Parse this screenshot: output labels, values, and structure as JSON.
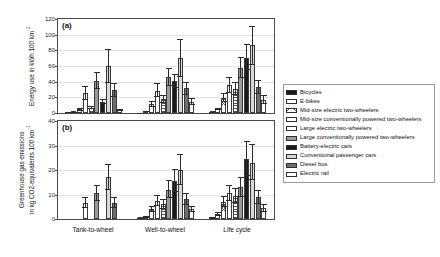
{
  "figure": {
    "panel_a_tag": "(a)",
    "panel_b_tag": "(b)"
  },
  "axes": {
    "panel_a": {
      "title_line1": "Energy use in kWh 100 km",
      "title_sup": "-1",
      "ticks": [
        "0",
        "20",
        "40",
        "60",
        "80",
        "100",
        "120"
      ]
    },
    "panel_b": {
      "title_line1": "Greenhouse gas emissions",
      "title_line2": "in kg CO2-equivalents 100 km",
      "title_sup": "-1",
      "ticks": [
        "0",
        "10",
        "20",
        "30",
        "40"
      ]
    },
    "x_categories": [
      "Tank-to-wheel",
      "Well-to-wheel",
      "Life cycle"
    ]
  },
  "legend": {
    "items": [
      {
        "label": "Bicycles",
        "fill": "f-black"
      },
      {
        "label": "E-bikes",
        "fill": "f-hatchdot"
      },
      {
        "label": "Mid-size electric two-wheelers",
        "fill": "f-hatchcross"
      },
      {
        "label": "Mid-size conventionally powered two-wheelers",
        "fill": "f-white"
      },
      {
        "label": "Large electric two-wheelers",
        "fill": "f-hatchfine"
      },
      {
        "label": "Large conventionally powered two-wheelers",
        "fill": "f-midgray"
      },
      {
        "label": "Battery-electric cars",
        "fill": "f-black"
      },
      {
        "label": "Conventional passenger cars",
        "fill": "f-ltgray"
      },
      {
        "label": "Diesel bus",
        "fill": "f-dkgray"
      },
      {
        "label": "Electric rail",
        "fill": "f-white"
      }
    ]
  },
  "chart_data": {
    "type": "bar",
    "title": "",
    "grid": true,
    "legend_position": "right",
    "series_names": [
      "Bicycles",
      "E-bikes",
      "Mid-size electric two-wheelers",
      "Mid-size conventionally powered two-wheelers",
      "Large electric two-wheelers",
      "Large conventionally powered two-wheelers",
      "Battery-electric cars",
      "Conventional passenger cars",
      "Diesel bus",
      "Electric rail"
    ],
    "panels": [
      {
        "tag": "(a)",
        "ylabel": "Energy use in kWh 100 km-1",
        "ylim": [
          0,
          120
        ],
        "yticks": [
          0,
          20,
          40,
          60,
          80,
          100,
          120
        ],
        "categories": [
          "Tank-to-wheel",
          "Well-to-wheel",
          "Life cycle"
        ],
        "groups": [
          {
            "category": "Tank-to-wheel",
            "values": [
              0.5,
              1.0,
              4.5,
              25.0,
              6.5,
              40.5,
              14.5,
              60.0,
              29.0,
              4.0
            ],
            "err_low": [
              0.3,
              0.5,
              1.5,
              8.0,
              2.0,
              10.0,
              3.0,
              22.0,
              8.0,
              1.5
            ],
            "err_high": [
              0.3,
              0.5,
              2.0,
              9.0,
              2.5,
              11.5,
              3.5,
              22.0,
              9.0,
              1.5
            ]
          },
          {
            "category": "Well-to-wheel",
            "values": [
              0.3,
              1.5,
              11.5,
              28.5,
              18.0,
              46.0,
              40.5,
              70.0,
              31.5,
              14.5
            ],
            "err_low": [
              0.2,
              0.6,
              3.5,
              8.5,
              5.0,
              11.0,
              9.0,
              24.0,
              8.0,
              4.0
            ],
            "err_high": [
              0.2,
              0.6,
              4.0,
              9.5,
              5.5,
              11.5,
              9.5,
              25.0,
              8.5,
              4.5
            ]
          },
          {
            "category": "Life cycle",
            "values": [
              1.0,
              5.0,
              19.5,
              35.5,
              30.5,
              57.5,
              70.5,
              86.5,
              33.0,
              17.0
            ],
            "err_low": [
              0.5,
              1.5,
              5.0,
              9.5,
              8.0,
              13.0,
              16.0,
              25.0,
              9.0,
              5.0
            ],
            "err_high": [
              0.5,
              1.8,
              5.5,
              10.5,
              8.5,
              14.0,
              17.0,
              25.0,
              9.5,
              5.5
            ]
          }
        ]
      },
      {
        "tag": "(b)",
        "ylabel": "Greenhouse gas emissions in kg CO2-equivalents 100 km-1",
        "ylim": [
          0,
          40
        ],
        "yticks": [
          0,
          10,
          20,
          30,
          40
        ],
        "categories": [
          "Tank-to-wheel",
          "Well-to-wheel",
          "Life cycle"
        ],
        "groups": [
          {
            "category": "Tank-to-wheel",
            "values": [
              0,
              0,
              0,
              6.5,
              0,
              10.5,
              0,
              17.0,
              6.5,
              0
            ],
            "err_low": [
              0,
              0,
              0,
              2.0,
              0,
              3.0,
              0,
              5.0,
              2.0,
              0
            ],
            "err_high": [
              0,
              0,
              0,
              2.5,
              0,
              3.5,
              0,
              5.5,
              2.5,
              0
            ]
          },
          {
            "category": "Well-to-wheel",
            "values": [
              0.2,
              0.8,
              4.0,
              7.5,
              6.0,
              12.0,
              15.5,
              20.0,
              8.0,
              4.0
            ],
            "err_low": [
              0.1,
              0.3,
              1.2,
              2.2,
              1.8,
              3.5,
              4.5,
              6.0,
              2.2,
              1.2
            ],
            "err_high": [
              0.1,
              0.4,
              1.4,
              2.5,
              2.0,
              3.8,
              5.0,
              6.5,
              2.5,
              1.4
            ]
          },
          {
            "category": "Life cycle",
            "values": [
              0.5,
              2.0,
              7.0,
              10.5,
              9.5,
              13.0,
              24.5,
              23.0,
              9.0,
              4.5
            ],
            "err_low": [
              0.3,
              0.8,
              2.2,
              3.0,
              2.8,
              4.0,
              7.0,
              7.0,
              2.8,
              1.5
            ],
            "err_high": [
              0.3,
              0.9,
              2.4,
              3.2,
              3.0,
              4.2,
              7.5,
              7.5,
              3.0,
              1.8
            ]
          }
        ]
      }
    ]
  }
}
